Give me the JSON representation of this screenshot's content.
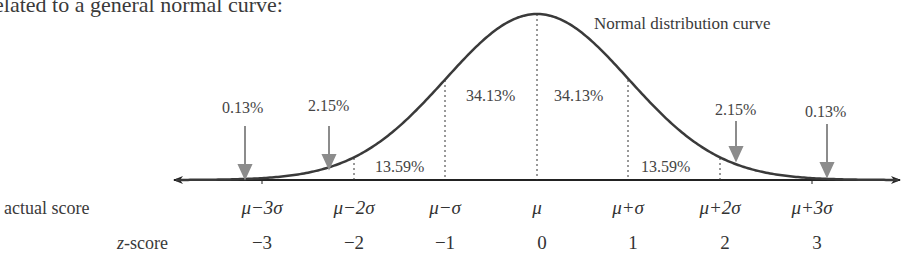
{
  "intro_text": "elated to a general normal curve:",
  "curve_label": "Normal distribution curve",
  "row_labels": {
    "actual_score": "actual score",
    "z_score_var": "z",
    "z_score_suffix": "-score"
  },
  "percent_labels": {
    "left_tail": "0.13%",
    "left_2": "2.15%",
    "left_1": "13.59%",
    "left_center": "34.13%",
    "right_center": "34.13%",
    "right_1": "13.59%",
    "right_2": "2.15%",
    "right_tail": "0.13%"
  },
  "actual_scores": [
    "μ−3σ",
    "μ−2σ",
    "μ−σ",
    "μ",
    "μ+σ",
    "μ+2σ",
    "μ+3σ"
  ],
  "z_scores": [
    "−3",
    "−2",
    "−1",
    "0",
    "1",
    "2",
    "3"
  ],
  "colors": {
    "curve": "#3a3a3a",
    "arrow": "#8c8c8c",
    "axis": "#222222"
  },
  "chart_data": {
    "type": "area",
    "title": "Normal distribution curve",
    "x": [
      -3,
      -2,
      -1,
      0,
      1,
      2,
      3
    ],
    "x_labels_actual": [
      "μ−3σ",
      "μ−2σ",
      "μ−σ",
      "μ",
      "μ+σ",
      "μ+2σ",
      "μ+3σ"
    ],
    "x_labels_z": [
      "−3",
      "−2",
      "−1",
      "0",
      "1",
      "2",
      "3"
    ],
    "regions": [
      {
        "range": [
          "-inf",
          -3
        ],
        "percent": 0.13
      },
      {
        "range": [
          -3,
          -2
        ],
        "percent": 2.15
      },
      {
        "range": [
          -2,
          -1
        ],
        "percent": 13.59
      },
      {
        "range": [
          -1,
          0
        ],
        "percent": 34.13
      },
      {
        "range": [
          0,
          1
        ],
        "percent": 34.13
      },
      {
        "range": [
          1,
          2
        ],
        "percent": 13.59
      },
      {
        "range": [
          2,
          3
        ],
        "percent": 2.15
      },
      {
        "range": [
          3,
          "inf"
        ],
        "percent": 0.13
      }
    ],
    "xlabel_rows": [
      "actual score",
      "z-score"
    ]
  }
}
